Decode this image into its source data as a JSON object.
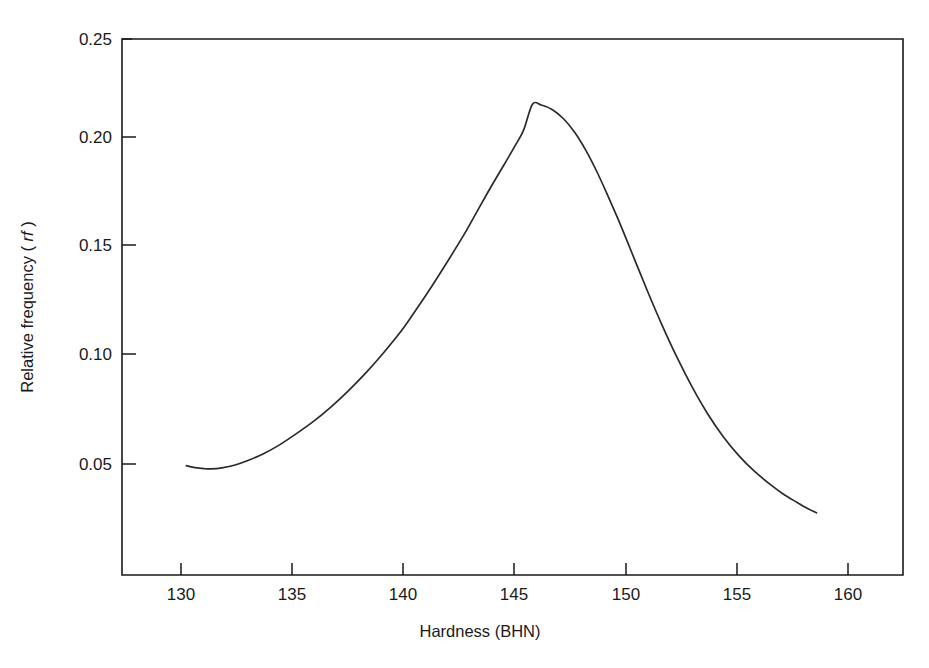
{
  "figure": {
    "background_color": "#ffffff",
    "line_color": "#2b2b2b",
    "axis_color": "#1a1a1a"
  },
  "chart_data": {
    "type": "line",
    "title": "",
    "subtitle": "",
    "xlabel": "Hardness (BHN)",
    "ylabel": "Relative frequency (rf)",
    "ylabel_plain": "Relative frequency",
    "ylabel_italic_part": "rf",
    "xlim": [
      127.3,
      162.5
    ],
    "ylim": [
      0.0,
      0.25
    ],
    "xticks": [
      130,
      135,
      140,
      145,
      150,
      155,
      160
    ],
    "xtick_labels": [
      "130",
      "135",
      "140",
      "145",
      "150",
      "155",
      "160"
    ],
    "yticks": [
      0.05,
      0.1,
      0.15,
      0.2,
      0.25
    ],
    "ytick_labels": [
      "0.05",
      "0.10",
      "0.15",
      "0.20",
      "0.25"
    ],
    "grid": false,
    "legend": null,
    "annotations": [],
    "series": [
      {
        "name": "Relative frequency distribution of hardness",
        "x": [
          130.2,
          130.6,
          131.0,
          131.3,
          131.8,
          132.4,
          133.0,
          133.7,
          134.4,
          135.1,
          135.9,
          136.7,
          137.5,
          138.3,
          139.1,
          139.9,
          140.6,
          141.3,
          142.0,
          142.7,
          143.3,
          143.9,
          144.5,
          145.0,
          145.4,
          145.8,
          146.2,
          146.7,
          147.2,
          147.7,
          148.2,
          148.7,
          149.2,
          149.8,
          150.4,
          151.0,
          151.6,
          152.3,
          153.0,
          153.7,
          154.4,
          155.1,
          155.8,
          156.5,
          157.1,
          157.7,
          158.2,
          158.6
        ],
        "y": [
          0.051,
          0.0501,
          0.0496,
          0.0495,
          0.05,
          0.0513,
          0.0535,
          0.0567,
          0.0607,
          0.0655,
          0.0714,
          0.0782,
          0.0859,
          0.0944,
          0.1038,
          0.114,
          0.1244,
          0.1353,
          0.1467,
          0.1585,
          0.1695,
          0.1805,
          0.191,
          0.1999,
          0.2075,
          0.2196,
          0.2192,
          0.217,
          0.2128,
          0.2065,
          0.1982,
          0.1882,
          0.1768,
          0.1625,
          0.1472,
          0.132,
          0.1175,
          0.1018,
          0.0876,
          0.0751,
          0.0645,
          0.0557,
          0.0484,
          0.0424,
          0.0378,
          0.034,
          0.031,
          0.029
        ],
        "peak": {
          "x": 145.8,
          "y": 0.22
        },
        "minimum_left": {
          "x": 131.3,
          "y": 0.0495
        },
        "start": {
          "x": 130.2,
          "y": 0.051
        },
        "end": {
          "x": 158.6,
          "y": 0.025
        }
      }
    ]
  }
}
